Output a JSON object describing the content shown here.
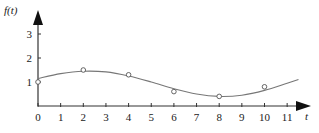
{
  "chart_data": {
    "type": "line",
    "title": "",
    "xlabel": "t",
    "ylabel": "f(t)",
    "xlim": [
      0,
      12
    ],
    "ylim": [
      0,
      3.5
    ],
    "x_ticks": [
      0,
      1,
      2,
      3,
      4,
      5,
      6,
      7,
      8,
      9,
      10,
      11
    ],
    "y_ticks": [
      1,
      2,
      3
    ],
    "grid": false,
    "legend": null,
    "series": [
      {
        "name": "fitted curve",
        "kind": "line",
        "x": [
          0,
          1,
          2,
          3,
          4,
          5,
          6,
          7,
          8,
          9,
          10,
          11,
          11.5
        ],
        "y": [
          1.15,
          1.35,
          1.45,
          1.42,
          1.25,
          1.0,
          0.72,
          0.5,
          0.4,
          0.45,
          0.65,
          0.95,
          1.1
        ]
      },
      {
        "name": "data points",
        "kind": "scatter",
        "marker": "open-circle",
        "x": [
          0,
          2,
          4,
          6,
          8,
          10
        ],
        "y": [
          1.0,
          1.5,
          1.3,
          0.6,
          0.4,
          0.8
        ]
      }
    ]
  },
  "axes": {
    "x_label": "t",
    "y_label": "f(t)",
    "x_tick_labels": [
      "0",
      "1",
      "2",
      "3",
      "4",
      "5",
      "6",
      "7",
      "8",
      "9",
      "10",
      "11"
    ],
    "y_tick_labels": [
      "1",
      "2",
      "3"
    ]
  }
}
